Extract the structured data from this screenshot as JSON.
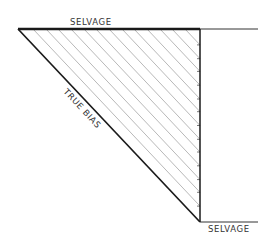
{
  "diagram": {
    "type": "fabric-bias-cut-diagram",
    "labels": {
      "top_selvage": "SELVAGE",
      "bottom_selvage": "SELVAGE",
      "hypotenuse": "TRUE BIAS"
    },
    "colors": {
      "outline": "#1a1a1a",
      "hatch": "#b0b0b0",
      "text": "#333333",
      "background": "#ffffff"
    },
    "geometry": {
      "top_left": [
        18,
        29
      ],
      "top_right": [
        200,
        29
      ],
      "bottom_right": [
        200,
        222
      ],
      "top_selvage_end_x": 258,
      "bottom_selvage_end_x": 258,
      "hatch_start_xs": [
        33,
        46,
        58,
        71,
        84,
        96,
        109,
        122,
        134,
        147,
        160,
        172,
        185
      ]
    }
  }
}
